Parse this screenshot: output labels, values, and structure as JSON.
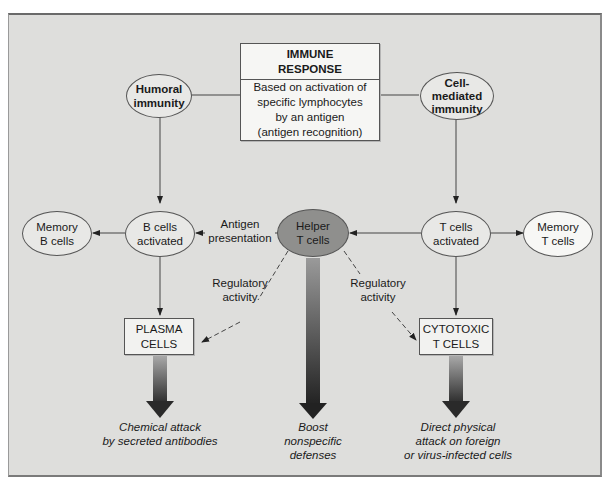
{
  "title_box": {
    "heading_line1": "IMMUNE",
    "heading_line2": "RESPONSE",
    "desc_line1": "Based on activation of",
    "desc_line2": "specific lymphocytes",
    "desc_line3": "by an antigen",
    "desc_line4": "(antigen recognition)"
  },
  "nodes": {
    "humoral": {
      "line1": "Humoral",
      "line2": "immunity"
    },
    "cell_mediated": {
      "line1": "Cell-",
      "line2": "mediated",
      "line3": "immunity"
    },
    "memory_b": {
      "line1": "Memory",
      "line2": "B cells"
    },
    "b_activated": {
      "line1": "B cells",
      "line2": "activated"
    },
    "helper_t": {
      "line1": "Helper",
      "line2": "T cells"
    },
    "t_activated": {
      "line1": "T cells",
      "line2": "activated"
    },
    "memory_t": {
      "line1": "Memory",
      "line2": "T cells"
    },
    "plasma": {
      "line1": "PLASMA",
      "line2": "CELLS"
    },
    "cytotoxic": {
      "line1": "CYTOTOXIC",
      "line2": "T CELLS"
    }
  },
  "edge_labels": {
    "antigen_presentation_1": "Antigen",
    "antigen_presentation_2": "presentation",
    "regulatory_left_1": "Regulatory",
    "regulatory_left_2": "activity",
    "regulatory_right_1": "Regulatory",
    "regulatory_right_2": "activity"
  },
  "outcomes": {
    "chemical": {
      "line1": "Chemical attack",
      "line2": "by secreted antibodies"
    },
    "boost": {
      "line1": "Boost",
      "line2": "nonspecific",
      "line3": "defenses"
    },
    "direct": {
      "line1": "Direct physical",
      "line2": "attack on foreign",
      "line3": "or virus-infected cells"
    }
  },
  "colors": {
    "panel_bg": "#dededc",
    "node_fill": "#e6e6e4",
    "helper_fill": "#8f8f8d",
    "memory_t_fill": "#f7f7f5",
    "arrow_dark": "#2a2a2a"
  }
}
